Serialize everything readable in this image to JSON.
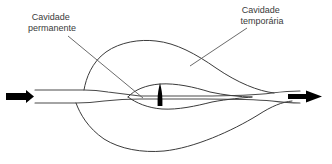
{
  "diagram": {
    "background_color": "#ffffff",
    "line_color": "#3b3b3b",
    "projectile_color": "#000000",
    "label_color": "#3a3a3a",
    "labels": [
      {
        "id": "permanent-cavity",
        "line1": "Cavidade",
        "line2": "permanente",
        "x": 28,
        "y": 20,
        "anchor": "middle"
      },
      {
        "id": "temporary-cavity",
        "line1": "Cavidade",
        "line2": "temporária",
        "x": 260,
        "y": 12,
        "anchor": "middle"
      }
    ],
    "leaders": [
      {
        "id": "permanent-cavity-leader",
        "from_x": 68,
        "from_y": 36,
        "to_x": 143,
        "to_y": 98
      },
      {
        "id": "temporary-cavity-leader",
        "from_x": 247,
        "from_y": 28,
        "to_x": 190,
        "to_y": 66
      }
    ],
    "arrows": [
      {
        "id": "entry-arrow",
        "direction": "right",
        "x": 14,
        "y": 96
      },
      {
        "id": "exit-arrow",
        "direction": "right",
        "x": 296,
        "y": 96
      }
    ],
    "projectile": {
      "id": "projectile",
      "center_x": 160,
      "top_y": 83,
      "bottom_y": 106,
      "width": 5
    }
  }
}
